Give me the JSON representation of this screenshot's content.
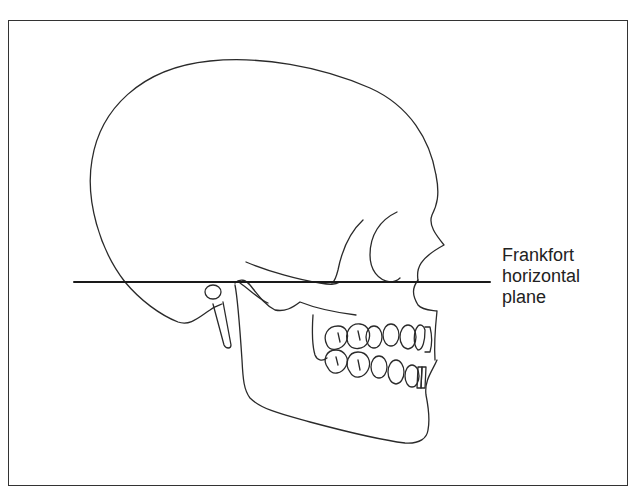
{
  "figure": {
    "label": {
      "lines": [
        "Frankfort",
        "horizontal",
        "plane"
      ]
    },
    "colors": {
      "line": "#2a2a2a",
      "frame": "#333333",
      "background": "#ffffff"
    }
  }
}
